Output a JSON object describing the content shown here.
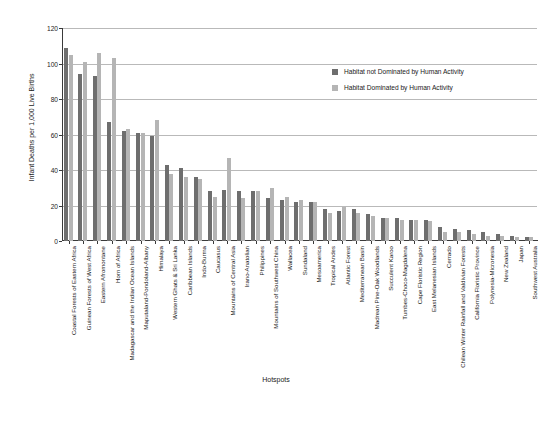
{
  "chart_data": {
    "type": "bar",
    "title": "",
    "xlabel": "Hotspots",
    "ylabel": "Infant Deaths per 1,000 Live Births",
    "ylim": [
      0,
      120
    ],
    "yticks": [
      0,
      20,
      40,
      60,
      80,
      100,
      120
    ],
    "grid": true,
    "legend_position": "upper-right",
    "colors": {
      "not_dominated": "#6e6e6e",
      "dominated": "#b5b5b5"
    },
    "categories": [
      "Coastal Forests of Eastern Africa",
      "Guinean Forests of West Africa",
      "Eastern Afromontane",
      "Horn of Africa",
      "Madagascar and the Indian Ocean Islands",
      "Maputaland-Pondoland-Albany",
      "Himalaya",
      "Western Ghats & Sri Lanka",
      "Caribbean Islands",
      "Indo-Burma",
      "Caucasus",
      "Mountains of Central Asia",
      "Irano-Anatolian",
      "Philippines",
      "Mountains of Southwest China",
      "Wallacea",
      "Sundaland",
      "Mesoamerica",
      "Tropical Andes",
      "Atlantic Forest",
      "Mediterranean Basin",
      "Madrean Pine-Oak Woodlands",
      "Succulent Karoo",
      "Tumbes-Choco-Magdalena",
      "Cape Floristic Region",
      "East Melanesian Islands",
      "Cerrado",
      "Chilean Winter Rainfall and Valdivian Forests",
      "California Floristic Province",
      "Polynesia-Micronesia",
      "New Zealand",
      "Japan",
      "Southwest Australia"
    ],
    "series": [
      {
        "name": "Habitat not Dominated by Human Activity",
        "values": [
          109,
          94,
          93,
          67,
          62,
          61,
          59,
          43,
          41,
          36,
          28,
          29,
          28,
          28,
          24,
          23,
          22,
          22,
          18,
          17,
          18,
          15,
          13,
          13,
          12,
          12,
          8,
          7,
          6,
          5,
          4,
          3,
          2
        ]
      },
      {
        "name": "Habitat Dominated by Human Activity",
        "values": [
          105,
          101,
          106,
          103,
          63,
          61,
          68,
          38,
          36,
          35,
          25,
          47,
          24,
          28,
          30,
          25,
          23,
          22,
          16,
          19,
          16,
          14,
          13,
          12,
          12,
          11,
          5,
          5,
          4,
          3,
          3,
          2,
          2
        ]
      }
    ]
  },
  "axis": {
    "y_title": "Infant Deaths per 1,000 Live Births",
    "x_title": "Hotspots"
  },
  "legend": {
    "items": [
      {
        "label": "Habitat not Dominated by Human Activity",
        "color": "#6e6e6e"
      },
      {
        "label": "Habitat Dominated by Human Activity",
        "color": "#b5b5b5"
      }
    ]
  }
}
